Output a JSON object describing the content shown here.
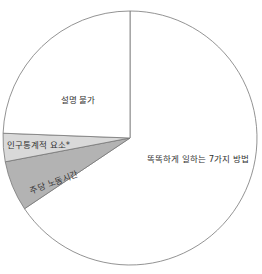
{
  "chart_data": {
    "type": "pie",
    "title": "",
    "categories": [
      "똑똑하게 일하는 7가지 방법",
      "주당 노동시간",
      "인구통계적 요소*",
      "설명 불가"
    ],
    "values": [
      65.6,
      6.4,
      3.6,
      24.4
    ],
    "colors": [
      "#ffffff",
      "#b3b3b3",
      "#d9d9d9",
      "#ffffff"
    ],
    "start_angle_deg": 0,
    "direction": "clockwise",
    "legend": "none (labels inside slices)"
  },
  "labels": {
    "main": "똑똑하게 일하는 7가지 방법",
    "labor": "주당 노동시간",
    "demo": "인구통계적 요소*",
    "unexplained": "설명 불가"
  }
}
